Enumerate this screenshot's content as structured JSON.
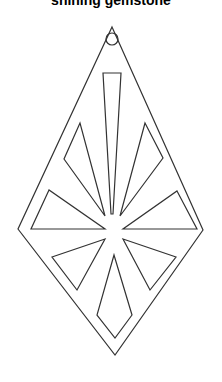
{
  "title": "shining gemstone",
  "artwork": {
    "subject": "diamond-shaped pendant outline with cut-out star shards and hanging hole",
    "stroke_color": "#333333",
    "background_color": "#ffffff",
    "parts": [
      "outer-diamond",
      "hanging-hole",
      "top-bar-shard",
      "upper-left-shard",
      "upper-right-shard",
      "left-triangle-shard",
      "right-triangle-shard",
      "lower-left-shard",
      "lower-right-shard",
      "bottom-kite-shard"
    ]
  }
}
